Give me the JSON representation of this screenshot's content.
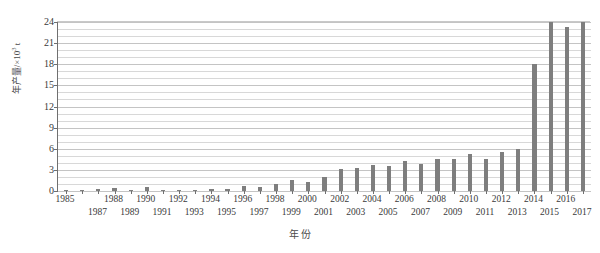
{
  "chart_data": {
    "type": "bar",
    "title": "",
    "xlabel": "年  份",
    "ylabel": "年产量/×10³ t",
    "ylabel_prefix": "年产量/×10",
    "ylabel_exponent": "3",
    "ylabel_suffix": " t",
    "ylim": [
      0,
      24
    ],
    "xlim_note": "1985-2017",
    "ytick_values": [
      0,
      3,
      6,
      9,
      12,
      15,
      18,
      21,
      24
    ],
    "ytick_labels": [
      "0",
      "3",
      "6",
      "9",
      "12",
      "15",
      "18",
      "21",
      "24"
    ],
    "minor_grid_step": 1,
    "grid": true,
    "legend": "none",
    "bar_color": "#7e7e7e",
    "axis_color": "#6f6f6f",
    "grid_color": "#d8d8d8",
    "categories": [
      "1985",
      "1986",
      "1987",
      "1988",
      "1989",
      "1990",
      "1991",
      "1992",
      "1993",
      "1994",
      "1995",
      "1996",
      "1997",
      "1998",
      "1999",
      "2000",
      "2001",
      "2002",
      "2003",
      "2004",
      "2005",
      "2006",
      "2007",
      "2008",
      "2009",
      "2010",
      "2011",
      "2012",
      "2013",
      "2014",
      "2015",
      "2016",
      "2017"
    ],
    "values": [
      0.12,
      0.1,
      0.3,
      0.45,
      0.2,
      0.55,
      0.15,
      0.18,
      0.2,
      0.22,
      0.35,
      0.7,
      0.55,
      0.95,
      1.6,
      1.25,
      2.0,
      3.1,
      3.25,
      3.7,
      3.55,
      4.25,
      3.85,
      4.55,
      4.6,
      5.2,
      4.6,
      5.55,
      5.9,
      18.0,
      24.3,
      23.3,
      24.3
    ],
    "xtick_rows": [
      0,
      1,
      1,
      0,
      1,
      0,
      1,
      0,
      1,
      0,
      1,
      0,
      1,
      0,
      1,
      0,
      1,
      0,
      1,
      0,
      1,
      0,
      1,
      0,
      1,
      0,
      1,
      0,
      1,
      0,
      1,
      0,
      1
    ],
    "xtick_visible": [
      1,
      0,
      1,
      1,
      1,
      1,
      1,
      1,
      1,
      1,
      1,
      1,
      1,
      1,
      1,
      1,
      1,
      1,
      1,
      1,
      1,
      1,
      1,
      1,
      1,
      1,
      1,
      1,
      1,
      1,
      1,
      1,
      1
    ]
  }
}
